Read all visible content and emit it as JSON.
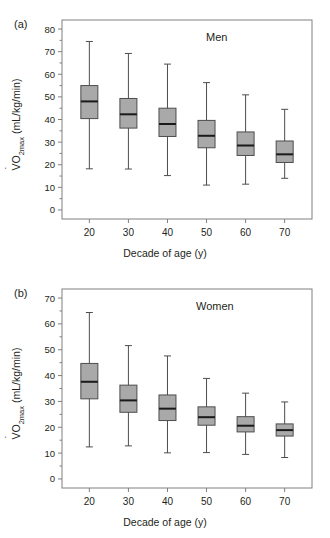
{
  "figure": {
    "width": 330,
    "height": 538,
    "background": "#ffffff",
    "box_fill": "#a9a9a9",
    "box_stroke": "#4d4d4d",
    "axis_color": "#808080",
    "text_color": "#231f20"
  },
  "panels": [
    {
      "key": "a",
      "label": "(a)",
      "group": "Men",
      "ylabel_prefix": "VO",
      "ylabel_sub": "2max",
      "ylabel_suffix": " (mL/kg/min)",
      "ylabel_full": "VO2max (mL/kg/min)",
      "xlabel": "Decade of age (y)",
      "chart_data": {
        "type": "box",
        "title": "Men",
        "xlabel": "Decade of age (y)",
        "ylabel": "VO2max (mL/kg/min)",
        "categories": [
          "20",
          "30",
          "40",
          "50",
          "60",
          "70"
        ],
        "xticklabels": [
          "20",
          "30",
          "40",
          "50",
          "60",
          "70"
        ],
        "yticklabels": [
          "0",
          "10",
          "20",
          "30",
          "40",
          "50",
          "60",
          "70",
          "80"
        ],
        "yticks": [
          0,
          10,
          20,
          30,
          40,
          50,
          60,
          70,
          80
        ],
        "ylim": [
          -4,
          84
        ],
        "xlim": [
          13,
          77
        ],
        "grid": false,
        "legend": false,
        "boxes": [
          {
            "category": "20",
            "x": 20,
            "whisker_low": 18.2,
            "q1": 40.4,
            "median": 48.0,
            "q3": 55.0,
            "whisker_high": 74.5
          },
          {
            "category": "30",
            "x": 30,
            "whisker_low": 18.1,
            "q1": 36.2,
            "median": 42.3,
            "q3": 49.3,
            "whisker_high": 69.2
          },
          {
            "category": "40",
            "x": 40,
            "whisker_low": 15.2,
            "q1": 32.5,
            "median": 38.0,
            "q3": 45.0,
            "whisker_high": 64.5
          },
          {
            "category": "50",
            "x": 50,
            "whisker_low": 11.0,
            "q1": 27.5,
            "median": 32.8,
            "q3": 39.6,
            "whisker_high": 56.3
          },
          {
            "category": "60",
            "x": 60,
            "whisker_low": 11.4,
            "q1": 24.1,
            "median": 28.5,
            "q3": 34.5,
            "whisker_high": 50.9
          },
          {
            "category": "70",
            "x": 70,
            "whisker_low": 14.0,
            "q1": 21.0,
            "median": 24.6,
            "q3": 30.5,
            "whisker_high": 44.5
          }
        ]
      }
    },
    {
      "key": "b",
      "label": "(b)",
      "group": "Women",
      "ylabel_prefix": "VO",
      "ylabel_sub": "2max",
      "ylabel_suffix": " (mL/kg/min)",
      "ylabel_full": "VO2max (mL/kg/min)",
      "xlabel": "Decade of age (y)",
      "chart_data": {
        "type": "box",
        "title": "Women",
        "xlabel": "Decade of age (y)",
        "ylabel": "VO2max (mL/kg/min)",
        "categories": [
          "20",
          "30",
          "40",
          "50",
          "60",
          "70"
        ],
        "xticklabels": [
          "20",
          "30",
          "40",
          "50",
          "60",
          "70"
        ],
        "yticklabels": [
          "0",
          "10",
          "20",
          "30",
          "40",
          "50",
          "60",
          "70"
        ],
        "yticks": [
          0,
          10,
          20,
          30,
          40,
          50,
          60,
          70
        ],
        "ylim": [
          -3.5,
          73.5
        ],
        "xlim": [
          13,
          77
        ],
        "grid": false,
        "legend": false,
        "boxes": [
          {
            "category": "20",
            "x": 20,
            "whisker_low": 12.4,
            "q1": 31.0,
            "median": 37.6,
            "q3": 44.7,
            "whisker_high": 64.4
          },
          {
            "category": "30",
            "x": 30,
            "whisker_low": 12.8,
            "q1": 25.8,
            "median": 30.4,
            "q3": 36.3,
            "whisker_high": 51.6
          },
          {
            "category": "40",
            "x": 40,
            "whisker_low": 10.1,
            "q1": 22.6,
            "median": 27.2,
            "q3": 32.5,
            "whisker_high": 47.6
          },
          {
            "category": "50",
            "x": 50,
            "whisker_low": 10.2,
            "q1": 20.8,
            "median": 23.9,
            "q3": 27.9,
            "whisker_high": 38.9
          },
          {
            "category": "60",
            "x": 60,
            "whisker_low": 9.5,
            "q1": 18.2,
            "median": 20.6,
            "q3": 24.1,
            "whisker_high": 33.2
          },
          {
            "category": "70",
            "x": 70,
            "whisker_low": 8.3,
            "q1": 16.6,
            "median": 18.9,
            "q3": 21.3,
            "whisker_high": 29.8
          }
        ]
      }
    }
  ]
}
